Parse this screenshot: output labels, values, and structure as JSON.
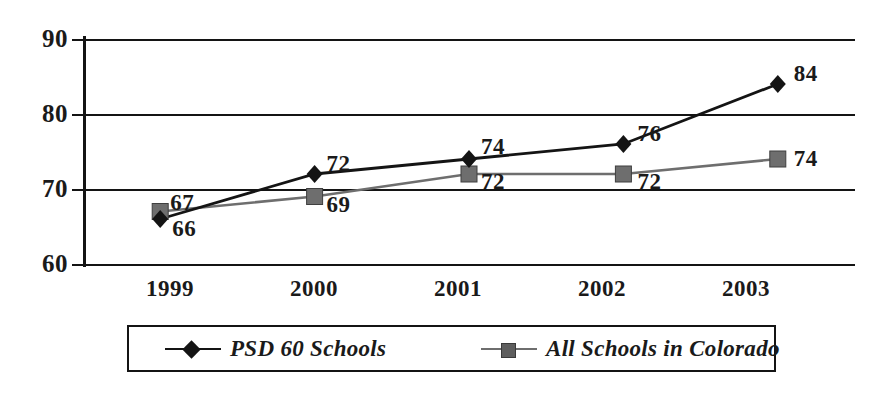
{
  "chart_data": {
    "type": "line",
    "title": "",
    "xlabel": "",
    "ylabel": "",
    "categories": [
      "1999",
      "2000",
      "2001",
      "2002",
      "2003"
    ],
    "ylim": [
      60,
      90
    ],
    "y_ticks": [
      "60",
      "70",
      "80",
      "90"
    ],
    "grid": true,
    "legend_position": "bottom",
    "series": [
      {
        "name": "PSD 60 Schools",
        "marker": "diamond",
        "color": "#141414",
        "values": [
          66,
          72,
          74,
          76,
          84
        ],
        "labels": [
          "66",
          "72",
          "74",
          "76",
          "84"
        ]
      },
      {
        "name": "All Schools in Colorado",
        "marker": "square",
        "color": "#6e6e6e",
        "values": [
          67,
          69,
          72,
          72,
          74
        ],
        "labels": [
          "67",
          "69",
          "72",
          "72",
          "74"
        ]
      }
    ]
  },
  "axes": {
    "y_tick_labels": [
      "90",
      "80",
      "70",
      "60"
    ],
    "x_tick_labels": [
      "1999",
      "2000",
      "2001",
      "2002",
      "2003"
    ]
  },
  "legend": {
    "entries": [
      {
        "label": "PSD 60 Schools",
        "marker": "diamond-marker",
        "color": "#141414"
      },
      {
        "label": "All Schools in Colorado",
        "marker": "square-marker",
        "color": "#6e6e6e"
      }
    ]
  },
  "colors": {
    "series_primary": "#141414",
    "series_secondary": "#6e6e6e",
    "axis": "#141414",
    "background": "#ffffff"
  }
}
